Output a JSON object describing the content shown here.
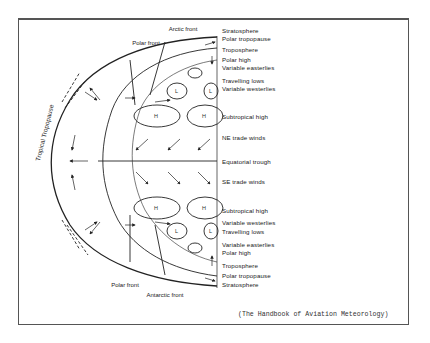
{
  "figure": {
    "caption": "(The Handbook of Aviation Meteorology)",
    "colors": {
      "line": "#222222",
      "background": "#ffffff",
      "frame": "#555555"
    }
  },
  "fronts": {
    "polar_front_north": "Polar front",
    "arctic_front": "Arctic front",
    "polar_front_south": "Polar front",
    "antarctic_front": "Antarctic front",
    "tropical_tropopause": "Tropical Tropopause"
  },
  "labels_north": [
    "Stratosphere",
    "Polar tropopause",
    "Troposphere",
    "Polar high",
    "Variable easterlies",
    "Travelling lows",
    "Variable westerlies",
    "Subtropical high",
    "NE trade winds"
  ],
  "equator": "Equatorial trough",
  "labels_south": [
    "SE trade winds",
    "Subtropical high",
    "Variable westerlies",
    "Travelling lows",
    "Variable easterlies",
    "Polar high",
    "Troposphere",
    "Polar tropopause",
    "Stratosphere"
  ],
  "pressure_cells": {
    "high": "H",
    "low": "L"
  }
}
